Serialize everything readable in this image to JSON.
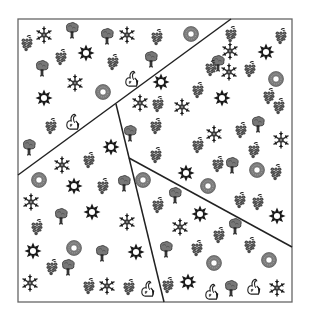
{
  "figure": {
    "description": "Square frame partitioned into five regions by three straight lines, each region filled with scattered pictogram icons",
    "frame": {
      "x": 18,
      "y": 19,
      "width": 274,
      "height": 283,
      "stroke": "#666666"
    },
    "lines": [
      {
        "name": "long-diagonal",
        "x1": 18,
        "y1": 175,
        "x2": 231,
        "y2": 19,
        "stroke": "#222222"
      },
      {
        "name": "steep-line",
        "x1": 116,
        "y1": 104,
        "x2": 164,
        "y2": 302,
        "stroke": "#222222"
      },
      {
        "name": "lower-diagonal",
        "x1": 129,
        "y1": 158,
        "x2": 292,
        "y2": 247,
        "stroke": "#222222"
      }
    ],
    "colors": {
      "dark": "#1a1a1a",
      "gray": "#555555",
      "ring": "#7a7a7a",
      "background": "#ffffff"
    },
    "icon_types": [
      "grapes",
      "snowflake",
      "tree",
      "star",
      "ring",
      "swan"
    ],
    "icons": [
      {
        "t": "grapes",
        "x": 27,
        "y": 43
      },
      {
        "t": "snowflake",
        "x": 44,
        "y": 35
      },
      {
        "t": "tree",
        "x": 72,
        "y": 30
      },
      {
        "t": "star",
        "x": 86,
        "y": 53
      },
      {
        "t": "grapes",
        "x": 61,
        "y": 57
      },
      {
        "t": "tree",
        "x": 107,
        "y": 36
      },
      {
        "t": "snowflake",
        "x": 127,
        "y": 35
      },
      {
        "t": "grapes",
        "x": 157,
        "y": 37
      },
      {
        "t": "ring",
        "x": 191,
        "y": 34
      },
      {
        "t": "tree",
        "x": 42,
        "y": 68
      },
      {
        "t": "grapes",
        "x": 113,
        "y": 62
      },
      {
        "t": "tree",
        "x": 151,
        "y": 59
      },
      {
        "t": "snowflake",
        "x": 75,
        "y": 83
      },
      {
        "t": "ring",
        "x": 103,
        "y": 92
      },
      {
        "t": "swan",
        "x": 132,
        "y": 78
      },
      {
        "t": "star",
        "x": 44,
        "y": 98
      },
      {
        "t": "swan",
        "x": 73,
        "y": 121
      },
      {
        "t": "grapes",
        "x": 51,
        "y": 126
      },
      {
        "t": "tree",
        "x": 29,
        "y": 147
      },
      {
        "t": "grapes",
        "x": 231,
        "y": 34
      },
      {
        "t": "star",
        "x": 266,
        "y": 52
      },
      {
        "t": "grapes",
        "x": 281,
        "y": 36
      },
      {
        "t": "snowflake",
        "x": 230,
        "y": 51
      },
      {
        "t": "tree",
        "x": 218,
        "y": 63
      },
      {
        "t": "grapes",
        "x": 211,
        "y": 68
      },
      {
        "t": "snowflake",
        "x": 229,
        "y": 72
      },
      {
        "t": "grapes",
        "x": 250,
        "y": 69
      },
      {
        "t": "ring",
        "x": 276,
        "y": 79
      },
      {
        "t": "grapes",
        "x": 269,
        "y": 96
      },
      {
        "t": "grapes",
        "x": 279,
        "y": 106
      },
      {
        "t": "star",
        "x": 161,
        "y": 82
      },
      {
        "t": "grapes",
        "x": 198,
        "y": 90
      },
      {
        "t": "star",
        "x": 222,
        "y": 98
      },
      {
        "t": "snowflake",
        "x": 182,
        "y": 107
      },
      {
        "t": "grapes",
        "x": 158,
        "y": 104
      },
      {
        "t": "snowflake",
        "x": 140,
        "y": 103
      },
      {
        "t": "grapes",
        "x": 156,
        "y": 126
      },
      {
        "t": "snowflake",
        "x": 214,
        "y": 134
      },
      {
        "t": "grapes",
        "x": 241,
        "y": 130
      },
      {
        "t": "tree",
        "x": 258,
        "y": 124
      },
      {
        "t": "snowflake",
        "x": 281,
        "y": 140
      },
      {
        "t": "grapes",
        "x": 198,
        "y": 145
      },
      {
        "t": "grapes",
        "x": 254,
        "y": 150
      },
      {
        "t": "tree",
        "x": 130,
        "y": 133
      },
      {
        "t": "grapes",
        "x": 156,
        "y": 155
      },
      {
        "t": "star",
        "x": 186,
        "y": 173
      },
      {
        "t": "tree",
        "x": 232,
        "y": 165
      },
      {
        "t": "grapes",
        "x": 218,
        "y": 164
      },
      {
        "t": "ring",
        "x": 257,
        "y": 170
      },
      {
        "t": "grapes",
        "x": 276,
        "y": 172
      },
      {
        "t": "ring",
        "x": 208,
        "y": 186
      },
      {
        "t": "grapes",
        "x": 240,
        "y": 200
      },
      {
        "t": "grapes",
        "x": 258,
        "y": 202
      },
      {
        "t": "star",
        "x": 277,
        "y": 216
      },
      {
        "t": "snowflake",
        "x": 62,
        "y": 165
      },
      {
        "t": "grapes",
        "x": 89,
        "y": 160
      },
      {
        "t": "star",
        "x": 111,
        "y": 147
      },
      {
        "t": "ring",
        "x": 39,
        "y": 180
      },
      {
        "t": "star",
        "x": 74,
        "y": 186
      },
      {
        "t": "grapes",
        "x": 103,
        "y": 186
      },
      {
        "t": "tree",
        "x": 124,
        "y": 183
      },
      {
        "t": "snowflake",
        "x": 31,
        "y": 202
      },
      {
        "t": "star",
        "x": 92,
        "y": 212
      },
      {
        "t": "tree",
        "x": 61,
        "y": 216
      },
      {
        "t": "grapes",
        "x": 37,
        "y": 227
      },
      {
        "t": "snowflake",
        "x": 127,
        "y": 222
      },
      {
        "t": "star",
        "x": 33,
        "y": 251
      },
      {
        "t": "ring",
        "x": 74,
        "y": 248
      },
      {
        "t": "tree",
        "x": 102,
        "y": 253
      },
      {
        "t": "star",
        "x": 136,
        "y": 252
      },
      {
        "t": "grapes",
        "x": 52,
        "y": 267
      },
      {
        "t": "tree",
        "x": 68,
        "y": 267
      },
      {
        "t": "snowflake",
        "x": 30,
        "y": 283
      },
      {
        "t": "grapes",
        "x": 89,
        "y": 286
      },
      {
        "t": "snowflake",
        "x": 107,
        "y": 286
      },
      {
        "t": "grapes",
        "x": 129,
        "y": 287
      },
      {
        "t": "swan",
        "x": 148,
        "y": 288
      },
      {
        "t": "ring",
        "x": 143,
        "y": 180
      },
      {
        "t": "grapes",
        "x": 158,
        "y": 205
      },
      {
        "t": "tree",
        "x": 175,
        "y": 195
      },
      {
        "t": "star",
        "x": 200,
        "y": 214
      },
      {
        "t": "snowflake",
        "x": 180,
        "y": 227
      },
      {
        "t": "tree",
        "x": 166,
        "y": 249
      },
      {
        "t": "grapes",
        "x": 197,
        "y": 248
      },
      {
        "t": "grapes",
        "x": 219,
        "y": 235
      },
      {
        "t": "tree",
        "x": 235,
        "y": 226
      },
      {
        "t": "grapes",
        "x": 250,
        "y": 245
      },
      {
        "t": "ring",
        "x": 214,
        "y": 263
      },
      {
        "t": "ring",
        "x": 269,
        "y": 260
      },
      {
        "t": "star",
        "x": 188,
        "y": 282
      },
      {
        "t": "grapes",
        "x": 168,
        "y": 285
      },
      {
        "t": "swan",
        "x": 212,
        "y": 291
      },
      {
        "t": "tree",
        "x": 231,
        "y": 288
      },
      {
        "t": "swan",
        "x": 254,
        "y": 286
      },
      {
        "t": "snowflake",
        "x": 277,
        "y": 288
      }
    ]
  }
}
